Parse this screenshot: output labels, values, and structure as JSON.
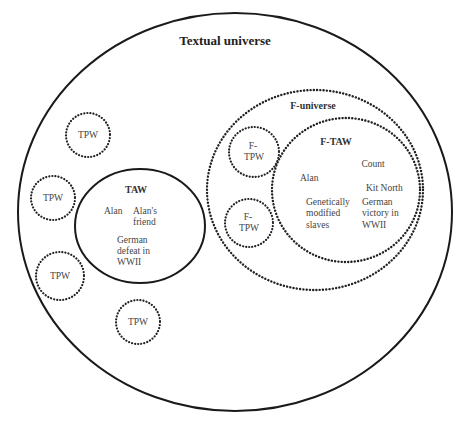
{
  "diagram": {
    "title": "Textual universe",
    "textual_universe": {
      "label": "Textual universe",
      "tpw_circles": [
        {
          "label": "TPW"
        },
        {
          "label": "TPW"
        },
        {
          "label": "TPW"
        },
        {
          "label": "TPW"
        }
      ],
      "taw": {
        "label": "TAW",
        "items": {
          "alan": "Alan",
          "alans_friend_line1": "Alan's",
          "alans_friend_line2": "friend",
          "german_defeat_line1": "German",
          "german_defeat_line2": "defeat in",
          "german_defeat_line3": "WWII"
        }
      },
      "f_universe": {
        "label": "F-universe",
        "f_tpw_circles": [
          {
            "line1": "F-",
            "line2": "TPW"
          },
          {
            "line1": "F-",
            "line2": "TPW"
          }
        ],
        "f_taw": {
          "label": "F-TAW",
          "items": {
            "count": "Count",
            "alan": "Alan",
            "kit_north": "Kit North",
            "slaves_line1": "Genetically",
            "slaves_line2": "modified",
            "slaves_line3": "slaves",
            "victory_line1": "German",
            "victory_line2": "victory in",
            "victory_line3": "WWII"
          }
        }
      }
    },
    "legend_colors": {
      "stroke": "#1a1a1a",
      "text": "#3a3a3a",
      "background": "#ffffff"
    }
  }
}
